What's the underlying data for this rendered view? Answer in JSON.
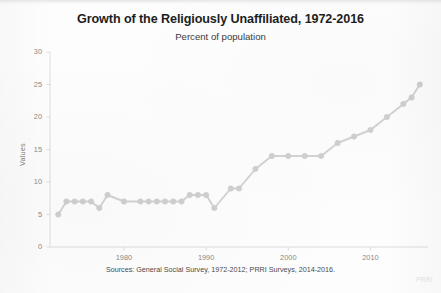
{
  "chart_data": {
    "type": "line",
    "title": "Growth of the Religiously Unaffiliated, 1972-2016",
    "subtitle": "Percent of population",
    "xlabel": "",
    "ylabel": "Values",
    "caption": "Sources: General Social Survey, 1972-2012; PRRI Surveys, 2014-2016.",
    "watermark": "PRRI",
    "grid": false,
    "legend": null,
    "xlim": [
      1971,
      2017
    ],
    "ylim": [
      0,
      30
    ],
    "xticks": [
      1980,
      1990,
      2000,
      2010
    ],
    "yticks": [
      0,
      5,
      10,
      15,
      20,
      25,
      30
    ],
    "line_color": "#d2d2d2",
    "marker_color": "#cfcfcf",
    "axis_color": "#dcdcdc",
    "x": [
      1972,
      1973,
      1974,
      1975,
      1976,
      1977,
      1978,
      1980,
      1982,
      1983,
      1984,
      1985,
      1986,
      1987,
      1988,
      1989,
      1990,
      1991,
      1993,
      1994,
      1996,
      1998,
      2000,
      2002,
      2004,
      2006,
      2008,
      2010,
      2012,
      2014,
      2015,
      2016
    ],
    "values": [
      5,
      7,
      7,
      7,
      7,
      6,
      8,
      7,
      7,
      7,
      7,
      7,
      7,
      7,
      8,
      8,
      8,
      6,
      9,
      9,
      12,
      14,
      14,
      14,
      14,
      16,
      17,
      18,
      20,
      22,
      23,
      25
    ]
  }
}
